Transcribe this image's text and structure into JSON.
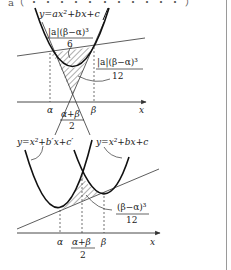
{
  "header": {
    "cut_text": "a（ ・ ・ ・ ・ ・ ・ ・ ・ ・ ・ ・ ）"
  },
  "colors": {
    "curve": "#111111",
    "line": "#333333",
    "axis": "#333333",
    "hatch": "#333333",
    "border": "#9a9a9a",
    "text": "#222222"
  },
  "figure1": {
    "curve_label": "y=ax²+bx+c",
    "area_upper": {
      "numerator": "|a|(β−α)³",
      "denominator": "6"
    },
    "area_lower": {
      "numerator": "|a|(β−α)³",
      "denominator": "12"
    },
    "tick_alpha": "α",
    "tick_beta": "β",
    "tick_mid_num": "α+β",
    "tick_mid_den": "2",
    "axis_label": "x"
  },
  "figure2": {
    "left_curve_label": "y=x²+b′x+c′",
    "right_curve_label": "y=x²+bx+c",
    "area": {
      "numerator": "(β−α)³",
      "denominator": "12"
    },
    "tick_alpha": "α",
    "tick_beta": "β",
    "tick_mid_num": "α+β",
    "tick_mid_den": "2",
    "axis_label": "x"
  }
}
